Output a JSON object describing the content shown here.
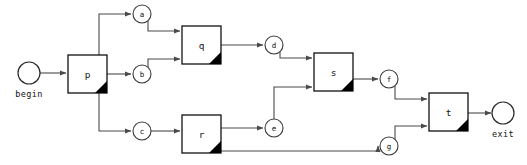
{
  "diagram": {
    "type": "flow-graph",
    "background_color": "#ffffff",
    "edge_color": "#4a4a4a",
    "box_stroke_color": "#111111",
    "corner_flag_color": "#000000",
    "terminals": [
      {
        "id": "begin",
        "label": "begin",
        "shape": "circle",
        "cx": 29,
        "cy": 73,
        "r": 11
      },
      {
        "id": "exit",
        "label": "exit",
        "shape": "circle",
        "cx": 503,
        "cy": 113,
        "r": 11
      }
    ],
    "process_nodes": [
      {
        "id": "p",
        "label": "p",
        "shape": "box-folded",
        "x": 68,
        "y": 55,
        "w": 39,
        "h": 38
      },
      {
        "id": "q",
        "label": "q",
        "shape": "box-folded",
        "x": 182,
        "y": 26,
        "w": 39,
        "h": 38
      },
      {
        "id": "r",
        "label": "r",
        "shape": "box-folded",
        "x": 182,
        "y": 115,
        "w": 39,
        "h": 38
      },
      {
        "id": "s",
        "label": "s",
        "shape": "box-folded",
        "x": 314,
        "y": 53,
        "w": 39,
        "h": 38
      },
      {
        "id": "t",
        "label": "t",
        "shape": "box-folded",
        "x": 429,
        "y": 93,
        "w": 39,
        "h": 38
      }
    ],
    "link_nodes": [
      {
        "id": "a",
        "label": "a",
        "shape": "circle",
        "cx": 142,
        "cy": 14,
        "r": 9
      },
      {
        "id": "b",
        "label": "b",
        "shape": "circle",
        "cx": 142,
        "cy": 74,
        "r": 9
      },
      {
        "id": "c",
        "label": "c",
        "shape": "circle",
        "cx": 142,
        "cy": 131,
        "r": 9
      },
      {
        "id": "d",
        "label": "d",
        "shape": "circle",
        "cx": 274,
        "cy": 45,
        "r": 9
      },
      {
        "id": "e",
        "label": "e",
        "shape": "circle",
        "cx": 274,
        "cy": 128,
        "r": 9
      },
      {
        "id": "f",
        "label": "f",
        "shape": "circle",
        "cx": 389,
        "cy": 79,
        "r": 9
      },
      {
        "id": "g",
        "label": "g",
        "shape": "circle",
        "cx": 389,
        "cy": 146,
        "r": 9
      }
    ],
    "edges": [
      {
        "from": "begin",
        "to": "p"
      },
      {
        "from": "p",
        "to": "a"
      },
      {
        "from": "p",
        "to": "b"
      },
      {
        "from": "p",
        "to": "c"
      },
      {
        "from": "a",
        "to": "q"
      },
      {
        "from": "b",
        "to": "q"
      },
      {
        "from": "q",
        "to": "d"
      },
      {
        "from": "c",
        "to": "r"
      },
      {
        "from": "r",
        "to": "e"
      },
      {
        "from": "r",
        "to": "g"
      },
      {
        "from": "d",
        "to": "s"
      },
      {
        "from": "e",
        "to": "s"
      },
      {
        "from": "s",
        "to": "f"
      },
      {
        "from": "f",
        "to": "t"
      },
      {
        "from": "g",
        "to": "t"
      },
      {
        "from": "t",
        "to": "exit"
      }
    ]
  }
}
